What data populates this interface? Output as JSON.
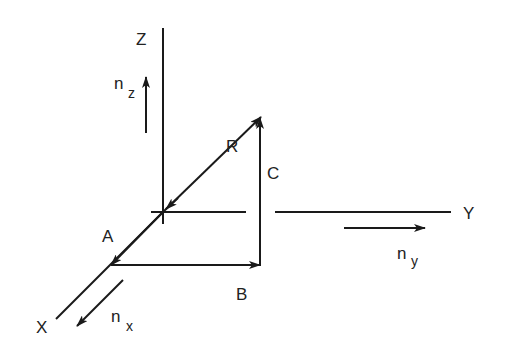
{
  "diagram": {
    "type": "3d-vector-decomposition",
    "axes": {
      "x": {
        "label": "X"
      },
      "y": {
        "label": "Y"
      },
      "z": {
        "label": "Z"
      }
    },
    "unit_vectors": {
      "nx": {
        "base": "n",
        "sub": "x"
      },
      "ny": {
        "base": "n",
        "sub": "y"
      },
      "nz": {
        "base": "n",
        "sub": "z"
      }
    },
    "points": {
      "R": "R",
      "A": "A",
      "B": "B",
      "C": "C"
    },
    "colors": {
      "stroke": "#1a1a1a",
      "background": "#ffffff"
    }
  }
}
